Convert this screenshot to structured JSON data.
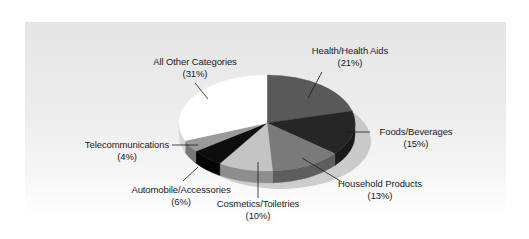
{
  "chart_data": {
    "type": "pie",
    "style": "3d",
    "title": "",
    "start_angle_deg": 0,
    "direction": "clockwise",
    "categories": [
      "Health/Health Aids",
      "Foods/Beverages",
      "Household Products",
      "Cosmetics/Toiletries",
      "Automobile/Accessories",
      "Telecommunications",
      "All Other Categories"
    ],
    "values": [
      21,
      15,
      13,
      10,
      6,
      4,
      31
    ],
    "value_labels": [
      "(21%)",
      "(15%)",
      "(13%)",
      "(10%)",
      "(6%)",
      "(4%)",
      "(31%)"
    ],
    "colors": [
      "#595959",
      "#262626",
      "#7a7a7a",
      "#c4c4c4",
      "#0d0d0d",
      "#9a9a9a",
      "#ffffff"
    ],
    "side_colors": [
      "#444444",
      "#1a1a1a",
      "#5e5e5e",
      "#8e8e8e",
      "#050505",
      "#767676",
      "#d8d8d8"
    ],
    "legend": "none (leader-line labels)",
    "unit": "%"
  },
  "labels": {
    "health": {
      "name": "Health/Health Aids",
      "pct": "(21%)"
    },
    "foods": {
      "name": "Foods/Beverages",
      "pct": "(15%)"
    },
    "household": {
      "name": "Household Products",
      "pct": "(13%)"
    },
    "cosmetics": {
      "name": "Cosmetics/Toiletries",
      "pct": "(10%)"
    },
    "automobile": {
      "name": "Automobile/Accessories",
      "pct": "(6%)"
    },
    "telecom": {
      "name": "Telecommunications",
      "pct": "(4%)"
    },
    "other": {
      "name": "All Other Categories",
      "pct": "(31%)"
    }
  }
}
